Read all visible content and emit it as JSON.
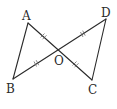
{
  "diagram": {
    "type": "geometry",
    "points": {
      "A": {
        "label": "A",
        "x": 28,
        "y": 23
      },
      "B": {
        "label": "B",
        "x": 13,
        "y": 79
      },
      "C": {
        "label": "C",
        "x": 92,
        "y": 80
      },
      "D": {
        "label": "D",
        "x": 106,
        "y": 19
      },
      "O": {
        "label": "O",
        "x": 60,
        "y": 51
      }
    },
    "segments": [
      {
        "from": "A",
        "to": "B"
      },
      {
        "from": "A",
        "to": "C"
      },
      {
        "from": "B",
        "to": "D"
      },
      {
        "from": "D",
        "to": "C"
      }
    ],
    "equal_marks": [
      {
        "segment": "AO",
        "marks": 2
      },
      {
        "segment": "OC",
        "marks": 2
      },
      {
        "segment": "BO",
        "marks": 2
      },
      {
        "segment": "OD",
        "marks": 2
      }
    ],
    "colors": {
      "stroke": "#2a2a2a",
      "background": "#ffffff"
    }
  }
}
